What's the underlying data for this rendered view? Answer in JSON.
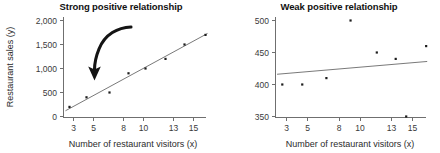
{
  "figure": {
    "background_color": "#ffffff",
    "point_color": "#1d1d1d",
    "line_color": "#6a6a6a",
    "axis_color": "#6f6f6f",
    "annotation_color": "#141414"
  },
  "panels": {
    "left": {
      "title": "Strong positive relationship",
      "xlabel": "Number of restaurant visitors (x)",
      "ylabel": "Restaurant sales (y)",
      "xticks": [
        "3",
        "5",
        "8",
        "10",
        "13",
        "15"
      ],
      "yticks": [
        "0",
        "500",
        "1,000",
        "1,500",
        "2,000"
      ],
      "annotation": "curved-arrow"
    },
    "right": {
      "title": "Weak positive relationship",
      "xlabel": "Number of restaurant visitors (x)",
      "ylabel": "",
      "xticks": [
        "3",
        "5",
        "8",
        "10",
        "13",
        "15"
      ],
      "yticks": [
        "350",
        "400",
        "450",
        "500"
      ]
    }
  },
  "chart_data": [
    {
      "type": "scatter",
      "title": "Strong positive relationship",
      "xlabel": "Number of restaurant visitors (x)",
      "ylabel": "Restaurant sales (y)",
      "xlim": [
        2,
        16.5
      ],
      "ylim": [
        0,
        2000
      ],
      "xticks": [
        3,
        5,
        8,
        10,
        13,
        15
      ],
      "yticks": [
        0,
        500,
        1000,
        1500,
        2000
      ],
      "grid": false,
      "legend": null,
      "x": [
        2.6,
        4.3,
        6.6,
        8.5,
        10.2,
        12.2,
        14.1,
        16.2
      ],
      "y": [
        200,
        400,
        500,
        900,
        1000,
        1200,
        1500,
        1700
      ],
      "trendline": {
        "type": "linear",
        "x": [
          2.2,
          16.4
        ],
        "y": [
          120,
          1730
        ]
      },
      "annotations": [
        {
          "type": "curved-arrow",
          "description": "curved arrow pointing down-left toward the data trend",
          "from_x": 7.0,
          "from_y": 1740,
          "to_x": 4.4,
          "to_y": 980
        }
      ]
    },
    {
      "type": "scatter",
      "title": "Weak positive relationship",
      "xlabel": "Number of restaurant visitors (x)",
      "ylabel": "",
      "xlim": [
        2,
        16.5
      ],
      "ylim": [
        350,
        500
      ],
      "xticks": [
        3,
        5,
        8,
        10,
        13,
        15
      ],
      "yticks": [
        350,
        400,
        450,
        500
      ],
      "grid": false,
      "legend": null,
      "x": [
        2.6,
        4.5,
        6.8,
        9.1,
        11.6,
        13.4,
        14.4,
        16.3
      ],
      "y": [
        400,
        400,
        410,
        500,
        450,
        440,
        350,
        460
      ],
      "trendline": {
        "type": "linear",
        "x": [
          2.1,
          16.4
        ],
        "y": [
          416,
          436
        ]
      },
      "annotations": []
    }
  ]
}
